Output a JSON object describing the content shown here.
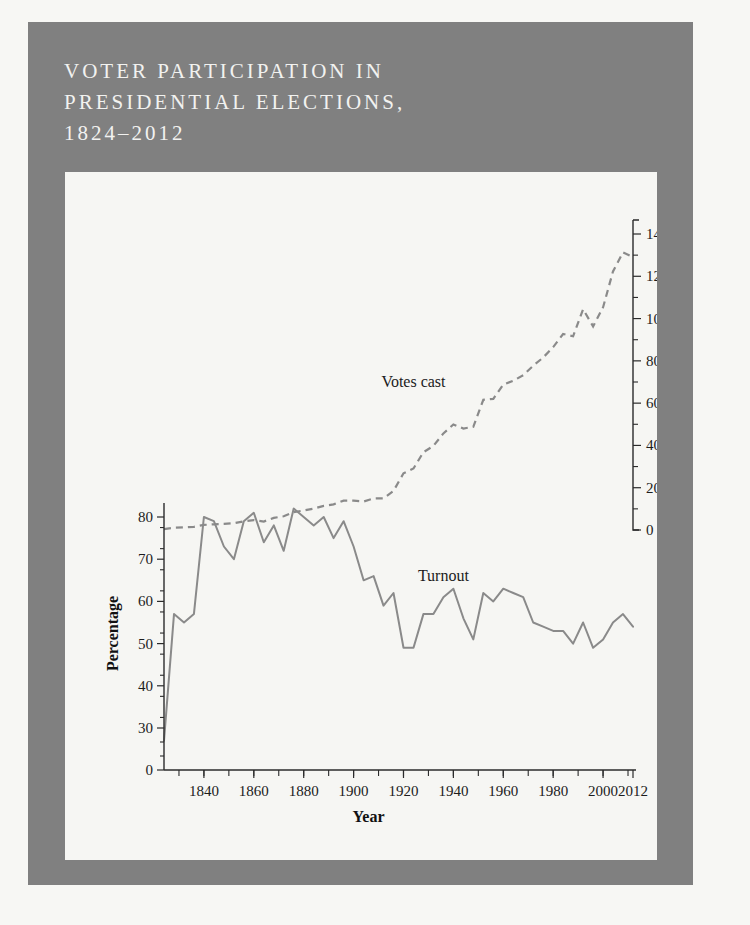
{
  "figure": {
    "title": "Voter Participation in\nPresidential Elections,\n1824–2012",
    "panel_color": "#808080",
    "plot_background": "#f6f6f3",
    "line_color": "#8a8a8a"
  },
  "chart_data": {
    "type": "line",
    "title": "Voter Participation in Presidential Elections, 1824–2012",
    "xlabel": "Year",
    "ylabel_left": "Percentage",
    "ylabel_right": "Million",
    "grid": false,
    "legend": "inline-labels",
    "xlim": [
      1824,
      2012
    ],
    "xticks_major": [
      1840,
      1860,
      1880,
      1900,
      1920,
      1940,
      1960,
      1980,
      2000,
      2012
    ],
    "xtick_labels": [
      "1840",
      "1860",
      "1880",
      "1900",
      "1920",
      "1940",
      "1960",
      "1980",
      "2000",
      "2012"
    ],
    "xticks_minor_step": 10,
    "left_axis": {
      "label": "Percentage",
      "ticks": [
        0,
        30,
        40,
        50,
        60,
        70,
        80
      ],
      "tick_labels": [
        "0",
        "30",
        "40",
        "50",
        "60",
        "70",
        "80"
      ],
      "note": "axis break between 0 and 30",
      "minor_step": 5
    },
    "right_axis": {
      "label": "Million",
      "ticks": [
        0,
        20,
        40,
        60,
        80,
        100,
        120,
        140
      ],
      "tick_labels": [
        "0",
        "20",
        "40",
        "60",
        "80",
        "100",
        "120",
        "140"
      ],
      "ylim": [
        0,
        140
      ],
      "minor_step": 10
    },
    "x": [
      1824,
      1828,
      1832,
      1836,
      1840,
      1844,
      1848,
      1852,
      1856,
      1860,
      1864,
      1868,
      1872,
      1876,
      1880,
      1884,
      1888,
      1892,
      1896,
      1900,
      1904,
      1908,
      1912,
      1916,
      1920,
      1924,
      1928,
      1932,
      1936,
      1940,
      1944,
      1948,
      1952,
      1956,
      1960,
      1964,
      1968,
      1972,
      1976,
      1980,
      1984,
      1988,
      1992,
      1996,
      2000,
      2004,
      2008,
      2012
    ],
    "series": [
      {
        "name": "Turnout",
        "axis": "left",
        "units": "percent",
        "style": "solid",
        "label_position": {
          "x": 1936,
          "y": 66
        },
        "values": [
          27,
          57,
          55,
          57,
          80,
          79,
          73,
          70,
          79,
          81,
          74,
          78,
          72,
          82,
          80,
          78,
          80,
          75,
          79,
          73,
          65,
          66,
          59,
          62,
          49,
          49,
          57,
          57,
          61,
          63,
          56,
          51,
          62,
          60,
          63,
          62,
          61,
          55,
          54,
          53,
          53,
          50,
          55,
          49,
          51,
          55,
          57,
          54
        ]
      },
      {
        "name": "Votes cast",
        "axis": "right",
        "units": "million",
        "style": "dashed",
        "label_position": {
          "x": 1924,
          "y": 70
        },
        "values": [
          0.4,
          1.1,
          1.3,
          1.5,
          2.4,
          2.7,
          2.9,
          3.2,
          4.1,
          4.7,
          4.0,
          5.7,
          6.5,
          8.4,
          9.2,
          10.1,
          11.4,
          12.1,
          13.9,
          13.9,
          13.5,
          14.9,
          15.0,
          18.5,
          26.8,
          29.1,
          36.8,
          39.8,
          45.7,
          49.9,
          48.0,
          48.8,
          61.6,
          62.0,
          68.8,
          70.6,
          73.2,
          77.7,
          81.6,
          86.5,
          92.7,
          91.6,
          104.4,
          96.3,
          105.4,
          122.3,
          131.3,
          129.1
        ]
      }
    ]
  }
}
